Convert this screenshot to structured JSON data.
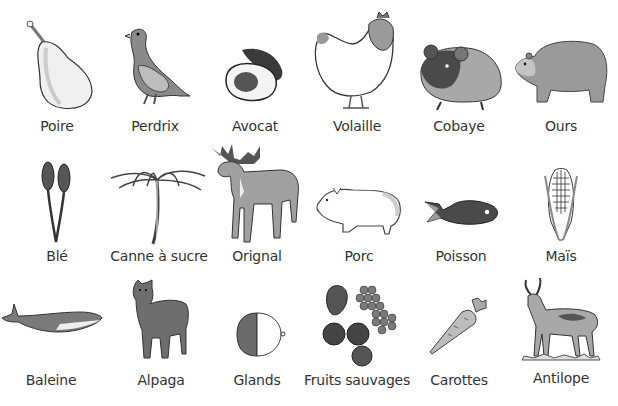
{
  "rows": [
    {
      "items": [
        {
          "label": "Poire",
          "icon": "pear-icon"
        },
        {
          "label": "Perdrix",
          "icon": "partridge-icon"
        },
        {
          "label": "Avocat",
          "icon": "avocado-icon"
        },
        {
          "label": "Volaille",
          "icon": "chicken-icon"
        },
        {
          "label": "Cobaye",
          "icon": "guinea-pig-icon"
        },
        {
          "label": "Ours",
          "icon": "bear-icon"
        }
      ]
    },
    {
      "items": [
        {
          "label": "Blé",
          "icon": "wheat-icon"
        },
        {
          "label": "Canne à sucre",
          "icon": "sugar-cane-icon"
        },
        {
          "label": "Orignal",
          "icon": "moose-icon"
        },
        {
          "label": "Porc",
          "icon": "pig-icon"
        },
        {
          "label": "Poisson",
          "icon": "fish-icon"
        },
        {
          "label": "Maïs",
          "icon": "corn-icon"
        }
      ]
    },
    {
      "items": [
        {
          "label": "Baleine",
          "icon": "whale-icon"
        },
        {
          "label": "Alpaga",
          "icon": "alpaca-icon"
        },
        {
          "label": "Glands",
          "icon": "acorn-icon"
        },
        {
          "label": "Fruits sauvages",
          "icon": "wild-berries-icon"
        },
        {
          "label": "Carottes",
          "icon": "carrot-icon"
        },
        {
          "label": "Antilope",
          "icon": "antelope-icon"
        }
      ]
    }
  ]
}
